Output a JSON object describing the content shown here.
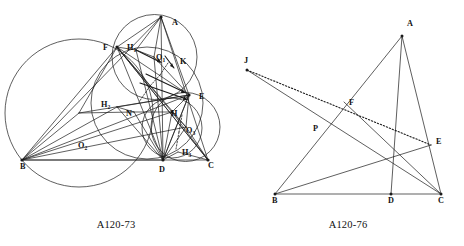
{
  "page": {
    "background": "#ffffff",
    "ink_color": "#1a1a1a",
    "width": 464,
    "height": 246
  },
  "figures": [
    {
      "id": "A120-73",
      "caption": "A120-73",
      "description": "Triangle ABC with altitude feet, nine-point circle and three circumcircles of sub-triangles",
      "labels": [
        {
          "key": "A",
          "text": "A",
          "sub": "",
          "x": 172,
          "y": 25
        },
        {
          "key": "F",
          "text": "F",
          "sub": "",
          "x": 103,
          "y": 50
        },
        {
          "key": "H1",
          "text": "H",
          "sub": "1",
          "x": 127,
          "y": 50
        },
        {
          "key": "O1",
          "text": "O",
          "sub": "1",
          "x": 156,
          "y": 60
        },
        {
          "key": "K",
          "text": "K",
          "sub": "",
          "x": 180,
          "y": 64
        },
        {
          "key": "E",
          "text": "E",
          "sub": "",
          "x": 199,
          "y": 99
        },
        {
          "key": "H2",
          "text": "H",
          "sub": "2",
          "x": 101,
          "y": 107
        },
        {
          "key": "N",
          "text": "N",
          "sub": "",
          "x": 126,
          "y": 116
        },
        {
          "key": "H",
          "text": "H",
          "sub": "",
          "x": 171,
          "y": 116
        },
        {
          "key": "O3",
          "text": "O",
          "sub": "3",
          "x": 186,
          "y": 133
        },
        {
          "key": "O2",
          "text": "O",
          "sub": "2",
          "x": 78,
          "y": 148
        },
        {
          "key": "H3",
          "text": "H",
          "sub": "3",
          "x": 182,
          "y": 155
        },
        {
          "key": "B",
          "text": "B",
          "sub": "",
          "x": 20,
          "y": 169
        },
        {
          "key": "D",
          "text": "D",
          "sub": "",
          "x": 159,
          "y": 172
        },
        {
          "key": "C",
          "text": "C",
          "sub": "",
          "x": 208,
          "y": 168
        }
      ]
    },
    {
      "id": "A120-76",
      "caption": "A120-76",
      "description": "Triangle ABC with cevians, point J outside and dotted line J to E",
      "labels": [
        {
          "key": "A",
          "text": "A",
          "sub": "",
          "x": 175,
          "y": 26
        },
        {
          "key": "J",
          "text": "J",
          "sub": "",
          "x": 12,
          "y": 63
        },
        {
          "key": "F",
          "text": "F",
          "sub": "",
          "x": 117,
          "y": 105
        },
        {
          "key": "P",
          "text": "P",
          "sub": "",
          "x": 81,
          "y": 131
        },
        {
          "key": "E",
          "text": "E",
          "sub": "",
          "x": 204,
          "y": 144
        },
        {
          "key": "B",
          "text": "B",
          "sub": "",
          "x": 40,
          "y": 203
        },
        {
          "key": "D",
          "text": "D",
          "sub": "",
          "x": 156,
          "y": 203
        },
        {
          "key": "C",
          "text": "C",
          "sub": "",
          "x": 206,
          "y": 203
        }
      ]
    }
  ]
}
